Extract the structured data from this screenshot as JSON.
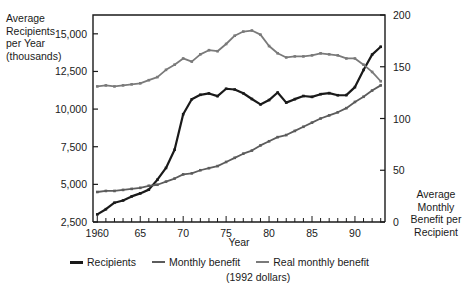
{
  "chart_data": {
    "type": "line",
    "title": "",
    "xlabel": "Year",
    "ylabel_left": "Average\nRecipients\nper Year\n(thousands)",
    "ylabel_right": "Average\nMonthly\nBenefit per\nRecipient",
    "x": [
      1960,
      1961,
      1962,
      1963,
      1964,
      1965,
      1966,
      1967,
      1968,
      1969,
      1970,
      1971,
      1972,
      1973,
      1974,
      1975,
      1976,
      1977,
      1978,
      1979,
      1980,
      1981,
      1982,
      1983,
      1984,
      1985,
      1986,
      1987,
      1988,
      1989,
      1990,
      1991,
      1992,
      1993
    ],
    "xlim": [
      1959.5,
      1993.5
    ],
    "xticks": [
      1960,
      1965,
      1970,
      1975,
      1980,
      1985,
      1990
    ],
    "xticklabels": [
      "1960",
      "65",
      "70",
      "75",
      "80",
      "85",
      "90"
    ],
    "xtick_minor_step": 1,
    "ylim_left": [
      2500,
      16250
    ],
    "yticks_left": [
      2500,
      5000,
      7500,
      10000,
      12500,
      15000
    ],
    "yticklabels_left": [
      "2,500",
      "5,000",
      "7,500",
      "10,000",
      "12,500",
      "15,000"
    ],
    "ylim_right": [
      0,
      200
    ],
    "yticks_right": [
      0,
      50,
      100,
      150,
      200
    ],
    "yticklabels_right": [
      "0",
      "50",
      "100",
      "150",
      "200"
    ],
    "grid": false,
    "legend_position": "below",
    "series": [
      {
        "name": "Recipients",
        "axis": "left",
        "color": "#1a1a1a",
        "width": 2.2,
        "marker": "square",
        "values": [
          3005,
          3350,
          3780,
          3930,
          4200,
          4400,
          4650,
          5310,
          6090,
          7300,
          9660,
          10650,
          10950,
          11040,
          10860,
          11350,
          11300,
          11050,
          10670,
          10310,
          10600,
          11100,
          10430,
          10660,
          10870,
          10810,
          10990,
          11060,
          10920,
          10930,
          11460,
          12600,
          13620,
          14140
        ]
      },
      {
        "name": "Monthly benefit",
        "axis": "right",
        "color": "#5c5c5c",
        "width": 1.8,
        "marker": "square",
        "values": [
          29,
          30,
          30,
          31,
          32,
          33,
          35,
          36,
          39,
          42,
          46,
          47,
          50,
          52,
          54,
          58,
          62,
          66,
          69,
          74,
          78,
          82,
          84,
          88,
          92,
          96,
          100,
          103,
          106,
          110,
          116,
          121,
          127,
          132
        ]
      },
      {
        "name": "Real monthly benefit (1992 dollars)",
        "axis": "right",
        "color": "#7a7a7a",
        "width": 1.8,
        "marker": "square",
        "values": [
          131,
          132,
          131,
          132,
          133,
          134,
          137,
          140,
          147,
          152,
          158,
          155,
          162,
          166,
          165,
          172,
          180,
          184,
          185,
          181,
          170,
          163,
          159,
          160,
          160,
          161,
          163,
          162,
          161,
          158,
          158,
          152,
          145,
          136
        ]
      }
    ]
  },
  "legend": {
    "items": [
      {
        "label": "Recipients",
        "color": "#1a1a1a",
        "thick": true
      },
      {
        "label": "Monthly benefit",
        "color": "#5c5c5c",
        "thick": false
      },
      {
        "label": "Real monthly benefit",
        "color": "#7a7a7a",
        "thick": false
      }
    ],
    "sublabel": "(1992 dollars)"
  }
}
